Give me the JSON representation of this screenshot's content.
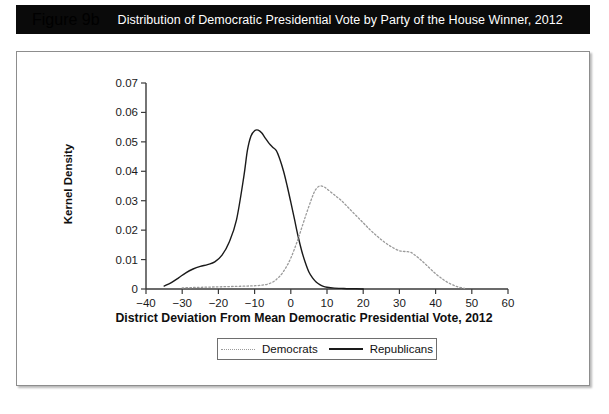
{
  "figure": {
    "number": "Figure 9b",
    "caption": "Distribution of Democratic Presidential Vote by Party of the House Winner, 2012"
  },
  "colors": {
    "header_background": "#0a0a0a",
    "header_text": "#ffffff",
    "republicans_line": "#1a1a1a",
    "democrats_line": "#9a9a9a",
    "axis": "#3a3a3a",
    "panel_border": "#8d8d8d"
  },
  "legend": {
    "position": "bottom-center",
    "entries": [
      {
        "label": "Democrats",
        "style": "dotted"
      },
      {
        "label": "Republicans",
        "style": "solid"
      }
    ]
  },
  "chart_data": {
    "type": "line",
    "title": "Distribution of Democratic Presidential Vote by Party of the House Winner, 2012",
    "xlabel": "District Deviation From Mean Democratic Presidential Vote, 2012",
    "ylabel": "Kernel Density",
    "xlim": [
      -40,
      60
    ],
    "ylim": [
      0,
      0.07
    ],
    "xticks": [
      -40,
      -30,
      -20,
      -10,
      0,
      10,
      20,
      30,
      40,
      50,
      60
    ],
    "xtick_labels": [
      "−40",
      "−30",
      "−20",
      "−10",
      "0",
      "10",
      "20",
      "30",
      "40",
      "50",
      "60"
    ],
    "yticks": [
      0,
      0.01,
      0.02,
      0.03,
      0.04,
      0.05,
      0.06,
      0.07
    ],
    "ytick_labels": [
      "0",
      "0.01",
      "0.02",
      "0.03",
      "0.04",
      "0.05",
      "0.06",
      "0.07"
    ],
    "grid": false,
    "legend_position": "bottom-center",
    "series": [
      {
        "name": "Republicans",
        "style": "solid",
        "color": "#1a1a1a",
        "x": [
          -35,
          -33,
          -31,
          -29,
          -27,
          -25,
          -23,
          -21,
          -19,
          -17,
          -15,
          -13,
          -12,
          -11,
          -10,
          -9,
          -8,
          -7,
          -6,
          -5,
          -4,
          -3,
          -2,
          -1,
          0,
          1,
          2,
          3,
          4,
          5,
          6,
          7,
          8,
          9,
          10,
          12,
          14,
          16,
          18,
          20
        ],
        "y": [
          0.001,
          0.0022,
          0.0038,
          0.0055,
          0.0068,
          0.0077,
          0.0083,
          0.0092,
          0.0115,
          0.016,
          0.0235,
          0.038,
          0.047,
          0.052,
          0.0538,
          0.054,
          0.053,
          0.0512,
          0.0495,
          0.0482,
          0.047,
          0.044,
          0.04,
          0.035,
          0.0295,
          0.0238,
          0.018,
          0.013,
          0.009,
          0.0058,
          0.0038,
          0.0024,
          0.0015,
          0.0009,
          0.0006,
          0.0003,
          0.0002,
          0.0001,
          0.0001,
          0.0
        ]
      },
      {
        "name": "Democrats",
        "style": "dotted",
        "color": "#9a9a9a",
        "x": [
          -30,
          -27,
          -24,
          -21,
          -18,
          -15,
          -12,
          -10,
          -8,
          -6,
          -4,
          -2,
          0,
          2,
          4,
          6,
          7,
          8,
          9,
          10,
          12,
          14,
          16,
          18,
          20,
          22,
          24,
          26,
          28,
          30,
          31,
          32,
          33,
          34,
          36,
          38,
          40,
          42,
          44,
          46,
          48
        ],
        "y": [
          0.0004,
          0.0005,
          0.0006,
          0.0007,
          0.0008,
          0.0009,
          0.001,
          0.0011,
          0.0013,
          0.0018,
          0.0032,
          0.006,
          0.0105,
          0.017,
          0.0245,
          0.0315,
          0.034,
          0.035,
          0.0348,
          0.034,
          0.032,
          0.03,
          0.0275,
          0.025,
          0.0225,
          0.02,
          0.0178,
          0.0158,
          0.0142,
          0.013,
          0.0128,
          0.0127,
          0.0125,
          0.0118,
          0.0098,
          0.0075,
          0.0052,
          0.0033,
          0.0018,
          0.0008,
          0.0002
        ]
      }
    ]
  }
}
